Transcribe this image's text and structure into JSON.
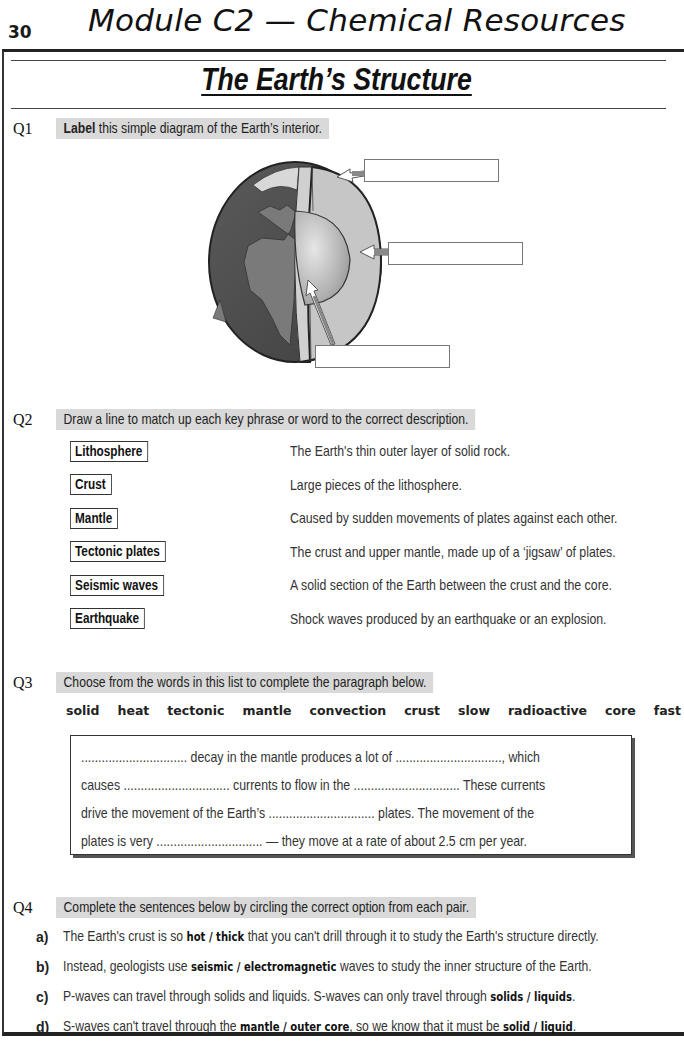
{
  "header": {
    "page_number": "30",
    "module_title": "Module C2 — Chemical Resources"
  },
  "section": {
    "title": "The Earth’s Structure"
  },
  "q1": {
    "number": "Q1",
    "prompt_bold": "Label",
    "prompt_rest": " this simple diagram of the Earth’s interior.",
    "diagram": {
      "icon": "earth-cross-section",
      "label_boxes": [
        "",
        "",
        ""
      ],
      "colors": {
        "continents": "#6e6e6e",
        "ocean": "#4a4a4a",
        "mantle": "#c9c9c9",
        "core": "#a9a9a9",
        "outline": "#222222"
      }
    }
  },
  "q2": {
    "number": "Q2",
    "prompt": "Draw a line to match up each key phrase or word to the correct description.",
    "terms": [
      "Lithosphere",
      "Crust",
      "Mantle",
      "Tectonic plates",
      "Seismic waves",
      "Earthquake"
    ],
    "descriptions": [
      "The Earth's thin outer layer of solid rock.",
      "Large pieces of the lithosphere.",
      "Caused by sudden movements of plates against each other.",
      "The crust and upper mantle, made up of a ‘jigsaw’ of plates.",
      "A solid section of the Earth between the crust and the core.",
      "Shock waves produced by an earthquake or an explosion."
    ]
  },
  "q3": {
    "number": "Q3",
    "prompt": "Choose from the words in this list to complete the paragraph below.",
    "words": [
      "solid",
      "heat",
      "tectonic",
      "mantle",
      "convection",
      "crust",
      "slow",
      "radioactive",
      "core",
      "fast"
    ],
    "paragraph_lines": [
      "............................... decay in the mantle produces a lot of ..............................., which",
      "causes ............................... currents to flow in the ............................... These currents",
      "drive the movement of the Earth’s ............................... plates.  The movement of the",
      "plates is very ...............................  — they move at a rate of about 2.5 cm per year."
    ]
  },
  "q4": {
    "number": "Q4",
    "prompt": "Complete the sentences below by circling the correct option from each pair.",
    "parts": [
      {
        "letter": "a)",
        "pre": "The Earth's crust is so ",
        "opt1": "hot / thick",
        "mid": " that you can't drill through it to study the Earth's structure directly.",
        "opt2": "",
        "post": ""
      },
      {
        "letter": "b)",
        "pre": "Instead, geologists use ",
        "opt1": "seismic / electromagnetic",
        "mid": " waves to study the inner structure of the Earth.",
        "opt2": "",
        "post": ""
      },
      {
        "letter": "c)",
        "pre": "P-waves can travel through solids and liquids.  S-waves can only travel through ",
        "opt1": "solids / liquids",
        "mid": ".",
        "opt2": "",
        "post": ""
      },
      {
        "letter": "d)",
        "pre": "S-waves can't travel through the ",
        "opt1": "mantle / outer core",
        "mid": ", so we know that it must be ",
        "opt2": "solid / liquid",
        "post": "."
      }
    ]
  }
}
